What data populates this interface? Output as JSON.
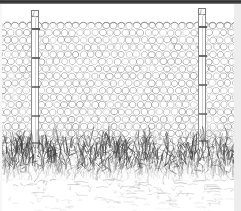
{
  "image": {
    "title": "Hexagonal wire mesh fence with posts and overgrown grass",
    "style": "pen-and-ink engraving line drawing",
    "width": 241,
    "height": 211,
    "background_color": "#ffffff",
    "ink_color": "#555555"
  },
  "borders": {
    "top_band": {
      "label": "top dark border band",
      "color": "#2e2e2e",
      "height": 4
    },
    "right_margin": {
      "label": "right paper margin strip",
      "color": "#ededed",
      "width": 7
    },
    "left_margin": {
      "label": "left paper margin strip",
      "color": "#f7f7f7",
      "width": 2
    }
  },
  "mesh": {
    "label": "hexagonal chicken-wire mesh",
    "line_color": "#8a8a8a",
    "top_y": 22,
    "bottom_y": 176,
    "cell_width": 7.6,
    "cell_height": 7.2,
    "columns": 32,
    "rows": 22
  },
  "posts": [
    {
      "name": "left-post",
      "label": "left fence post",
      "x": 31,
      "top_y": 11,
      "bottom_y": 150,
      "width": 8,
      "color": "#8d8d8d",
      "tie_ys": [
        28,
        57,
        86,
        115,
        142
      ]
    },
    {
      "name": "right-post",
      "label": "right fence post",
      "x": 198,
      "top_y": 9,
      "bottom_y": 150,
      "width": 8,
      "color": "#8d8d8d",
      "tie_ys": [
        26,
        55,
        84,
        113,
        140
      ]
    }
  ],
  "grass": {
    "label": "overgrown grass and weeds at fence base",
    "top_y": 130,
    "bottom_y": 180,
    "dense_color": "#3f3f3f",
    "light_color": "#9b9b9b",
    "blade_count": 520
  },
  "ground": {
    "label": "ground with scattered dry grass strokes",
    "top_y": 178,
    "bottom_y": 211,
    "stroke_color": "#a8a8a8",
    "stroke_count": 90
  }
}
